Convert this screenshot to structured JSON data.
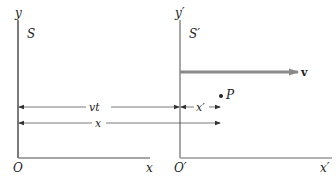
{
  "diagram": {
    "frame_s": {
      "name": "S",
      "y_axis_label": "y",
      "x_axis_label": "x",
      "origin_label": "O"
    },
    "frame_s_prime": {
      "name": "S′",
      "y_axis_label": "y′",
      "x_axis_label": "x′",
      "origin_label": "O′"
    },
    "velocity": {
      "label": "v",
      "color": "#8a8a8a"
    },
    "dimensions": {
      "vt_label": "vt",
      "x_label": "x",
      "x_prime_label": "x′"
    },
    "point": {
      "label": "P"
    },
    "colors": {
      "axis": "#333333",
      "axis_prime": "#888888",
      "dimension_line": "#444444"
    }
  }
}
